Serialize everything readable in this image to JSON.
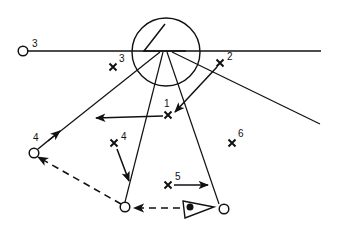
{
  "diagram": {
    "stroke_color": "#111111",
    "background": "#ffffff",
    "lookout": {
      "circle": {
        "cx": 166,
        "cy": 52,
        "r": 34
      },
      "triangle": [
        [
          165,
          24
        ],
        [
          144,
          51
        ],
        [
          186,
          51
        ]
      ]
    },
    "horizon_line": {
      "x1": 27,
      "y1": 51,
      "x2": 321,
      "y2": 51
    },
    "rays": [
      {
        "from": [
          160,
          52
        ],
        "to": [
          48,
          141
        ]
      },
      {
        "from": [
          163,
          52
        ],
        "to": [
          125,
          202
        ]
      },
      {
        "from": [
          167,
          52
        ],
        "to": [
          219,
          204
        ]
      },
      {
        "from": [
          172,
          52
        ],
        "to": [
          320,
          124
        ]
      }
    ],
    "open_circles": [
      {
        "id": "3",
        "cx": 23,
        "cy": 51,
        "label": "3",
        "lx": 32,
        "ly": 47
      },
      {
        "id": "4",
        "cx": 34,
        "cy": 153,
        "label": "4",
        "lx": 33,
        "ly": 141
      },
      {
        "id": "bottom",
        "cx": 125,
        "cy": 207,
        "label": "",
        "lx": 0,
        "ly": 0
      },
      {
        "id": "right",
        "cx": 224,
        "cy": 209,
        "label": "",
        "lx": 0,
        "ly": 0
      }
    ],
    "crosses": [
      {
        "id": "1",
        "x": 168,
        "y": 115,
        "label": "1",
        "lx": 164,
        "ly": 107
      },
      {
        "id": "2",
        "x": 220,
        "y": 63,
        "label": "2",
        "lx": 227,
        "ly": 60
      },
      {
        "id": "3",
        "x": 113,
        "y": 67,
        "label": "3",
        "lx": 119,
        "ly": 62
      },
      {
        "id": "4",
        "x": 114,
        "y": 143,
        "label": "4",
        "lx": 121,
        "ly": 140
      },
      {
        "id": "5",
        "x": 168,
        "y": 185,
        "label": "5",
        "lx": 175,
        "ly": 180
      },
      {
        "id": "6",
        "x": 232,
        "y": 143,
        "label": "6",
        "lx": 238,
        "ly": 137
      }
    ],
    "solid_arrows": [
      {
        "from": [
          38,
          149
        ],
        "to": [
          60,
          131
        ]
      },
      {
        "from": [
          163,
          116
        ],
        "to": [
          96,
          118
        ]
      },
      {
        "from": [
          217,
          67
        ],
        "to": [
          175,
          112
        ]
      },
      {
        "from": [
          117,
          149
        ],
        "to": [
          129,
          181
        ]
      },
      {
        "from": [
          174,
          185
        ],
        "to": [
          208,
          185
        ]
      }
    ],
    "dashed_arrows": [
      {
        "from": [
          121,
          204
        ],
        "to": [
          38,
          157
        ]
      },
      {
        "from": [
          180,
          208
        ],
        "to": [
          134,
          208
        ]
      }
    ],
    "flag": {
      "triangle": [
        [
          183,
          201
        ],
        [
          214,
          207
        ],
        [
          185,
          218
        ]
      ],
      "dot": {
        "cx": 190,
        "cy": 207,
        "r": 3.5
      }
    }
  }
}
